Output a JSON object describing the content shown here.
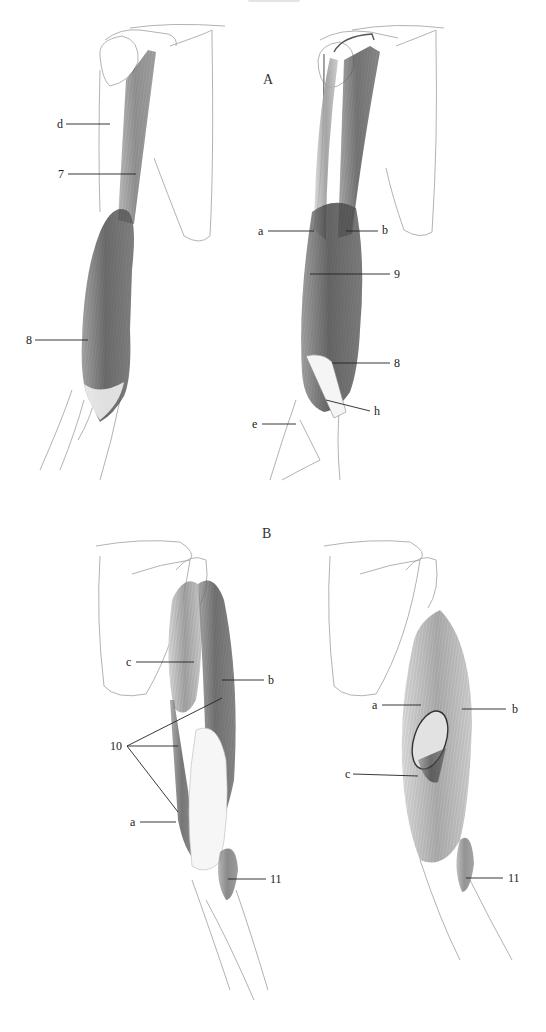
{
  "page": {
    "running_head": "",
    "sections": [
      {
        "id": "A",
        "label": "A",
        "x": 263,
        "y": 72
      },
      {
        "id": "B",
        "label": "B",
        "x": 262,
        "y": 530
      }
    ]
  },
  "figures": [
    {
      "id": "A-left",
      "section": "A",
      "view": "arm-anterior-superficial",
      "labels": [
        {
          "text": "d",
          "x": 57,
          "y": 118,
          "line": [
            66,
            124,
            110,
            124
          ]
        },
        {
          "text": "7",
          "x": 58,
          "y": 168,
          "line": [
            68,
            174,
            136,
            174
          ]
        },
        {
          "text": "8",
          "x": 26,
          "y": 334,
          "line": [
            35,
            340,
            88,
            340
          ]
        }
      ]
    },
    {
      "id": "A-right",
      "section": "A",
      "view": "arm-anterior-deep",
      "labels": [
        {
          "text": "a",
          "x": 258,
          "y": 225,
          "line": [
            268,
            231,
            314,
            231
          ]
        },
        {
          "text": "b",
          "x": 382,
          "y": 225,
          "line": [
            346,
            231,
            378,
            231
          ]
        },
        {
          "text": "9",
          "x": 394,
          "y": 266,
          "line": [
            310,
            274,
            390,
            274
          ]
        },
        {
          "text": "8",
          "x": 394,
          "y": 357,
          "line": [
            332,
            363,
            390,
            363
          ]
        },
        {
          "text": "h",
          "x": 374,
          "y": 405,
          "line": [
            326,
            400,
            370,
            411
          ]
        },
        {
          "text": "e",
          "x": 252,
          "y": 418,
          "line": [
            262,
            424,
            296,
            424
          ]
        }
      ]
    },
    {
      "id": "B-left",
      "section": "B",
      "view": "arm-posterior-superficial",
      "labels": [
        {
          "text": "c",
          "x": 126,
          "y": 656,
          "line": [
            136,
            662,
            194,
            662
          ]
        },
        {
          "text": "b",
          "x": 268,
          "y": 675,
          "line": [
            222,
            680,
            264,
            680
          ]
        },
        {
          "text": "10",
          "x": 110,
          "y": 740,
          "line_fan": [
            [
              127,
              746,
              222,
              698
            ],
            [
              127,
              746,
              178,
              746
            ],
            [
              127,
              746,
              178,
              812
            ]
          ]
        },
        {
          "text": "a",
          "x": 130,
          "y": 816,
          "line": [
            140,
            822,
            176,
            822
          ]
        },
        {
          "text": "11",
          "x": 270,
          "y": 874,
          "line": [
            228,
            879,
            266,
            879
          ]
        }
      ]
    },
    {
      "id": "B-right",
      "section": "B",
      "view": "arm-posterior-deep",
      "labels": [
        {
          "text": "a",
          "x": 372,
          "y": 700,
          "line": [
            382,
            705,
            421,
            705
          ]
        },
        {
          "text": "b",
          "x": 512,
          "y": 704,
          "line": [
            462,
            709,
            506,
            709
          ]
        },
        {
          "text": "c",
          "x": 345,
          "y": 768,
          "line": [
            353,
            774,
            418,
            776
          ]
        },
        {
          "text": "11",
          "x": 508,
          "y": 872,
          "line": [
            466,
            878,
            503,
            878
          ]
        }
      ]
    }
  ],
  "colors": {
    "paper": "#ffffff",
    "ink": "#222222",
    "pencil_light": "#b5b5b5",
    "muscle_dark": "#3a3a3a",
    "muscle_mid": "#7a7a7a"
  }
}
